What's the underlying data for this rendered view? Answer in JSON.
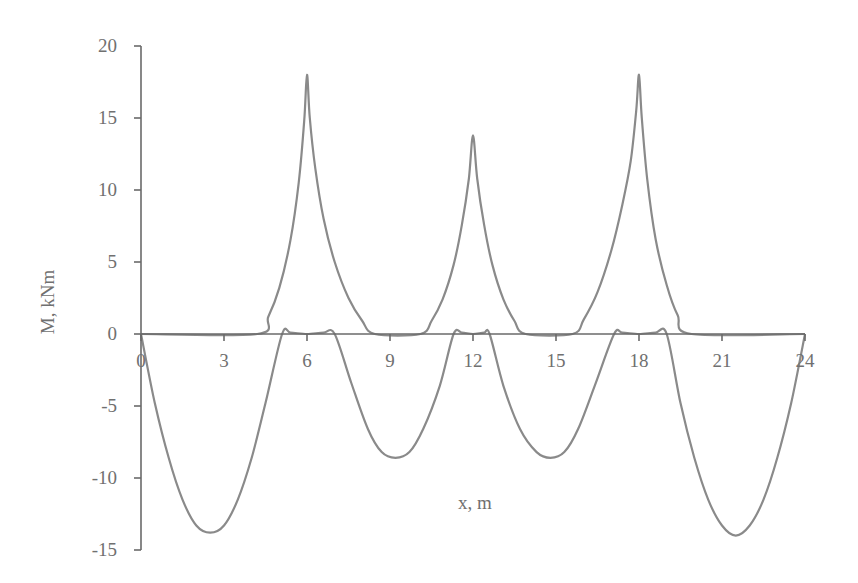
{
  "chart_data": {
    "type": "line",
    "title": "",
    "xlabel": "x, m",
    "ylabel": "M, kNm",
    "xlim": [
      0,
      24
    ],
    "ylim": [
      -15,
      20
    ],
    "x_ticks": [
      0,
      3,
      6,
      9,
      12,
      15,
      18,
      21,
      24
    ],
    "x_tick_labels": [
      "0",
      "3",
      "6",
      "9",
      "12",
      "15",
      "18",
      "21",
      "24"
    ],
    "y_ticks": [
      20,
      15,
      10,
      5,
      0,
      -5,
      -10,
      -15
    ],
    "y_tick_labels": [
      "20",
      "15",
      "10",
      "5",
      "0",
      "-5",
      "-10",
      "-15"
    ],
    "grid": false,
    "legend": null,
    "series": [
      {
        "name": "positive envelope (support moments)",
        "color": "#8a8a8a",
        "x": [
          0,
          4.2,
          4.6,
          5.0,
          5.4,
          5.7,
          5.9,
          6.0,
          6.1,
          6.3,
          6.6,
          7.0,
          7.5,
          8.0,
          8.45,
          10.1,
          10.5,
          10.9,
          11.3,
          11.6,
          11.85,
          12.0,
          12.15,
          12.4,
          12.7,
          13.1,
          13.5,
          13.9,
          15.6,
          16.0,
          16.5,
          17.0,
          17.4,
          17.7,
          17.9,
          18.0,
          18.1,
          18.3,
          18.6,
          19.0,
          19.4,
          19.9,
          24
        ],
        "y": [
          0,
          0,
          1.2,
          3.2,
          6.5,
          10.5,
          14.8,
          18.0,
          15.0,
          11.5,
          8.0,
          5.0,
          2.5,
          0.9,
          0,
          0,
          0.9,
          2.4,
          4.8,
          7.6,
          10.8,
          13.8,
          10.8,
          7.6,
          4.8,
          2.4,
          0.9,
          0,
          0,
          1.0,
          2.9,
          5.8,
          9.0,
          12.0,
          15.5,
          18.0,
          15.0,
          10.7,
          6.6,
          3.4,
          1.3,
          0,
          0
        ]
      },
      {
        "name": "negative envelope (span moments)",
        "color": "#8a8a8a",
        "x": [
          0,
          0.5,
          1.0,
          1.5,
          2.0,
          2.5,
          3.0,
          3.5,
          4.0,
          4.5,
          5.1,
          5.4,
          6.0,
          6.6,
          7.0,
          7.6,
          8.2,
          8.7,
          9.2,
          9.7,
          10.2,
          10.8,
          11.3,
          11.6,
          12.0,
          12.4,
          12.6,
          13.1,
          13.7,
          14.3,
          14.8,
          15.3,
          15.8,
          16.4,
          17.1,
          17.4,
          18.0,
          18.6,
          19.0,
          19.5,
          20.0,
          20.5,
          21.0,
          21.5,
          22.0,
          22.5,
          23.0,
          23.5,
          24.0
        ],
        "y": [
          0,
          -4.8,
          -8.6,
          -11.5,
          -13.3,
          -13.8,
          -13.3,
          -11.5,
          -8.6,
          -4.8,
          0,
          0.1,
          0,
          0.1,
          0,
          -3.4,
          -6.6,
          -8.2,
          -8.6,
          -8.2,
          -6.6,
          -3.6,
          0,
          0.1,
          0,
          0.1,
          0,
          -3.6,
          -6.6,
          -8.2,
          -8.6,
          -8.2,
          -6.6,
          -3.6,
          0,
          0.1,
          0,
          0.1,
          0,
          -4.8,
          -8.6,
          -11.5,
          -13.3,
          -14.0,
          -13.3,
          -11.5,
          -8.6,
          -4.8,
          0
        ]
      }
    ]
  },
  "plot_area": {
    "x0_px": 141,
    "x24_px": 805,
    "y0_px": 334,
    "px_per_kNm": 14.4
  }
}
